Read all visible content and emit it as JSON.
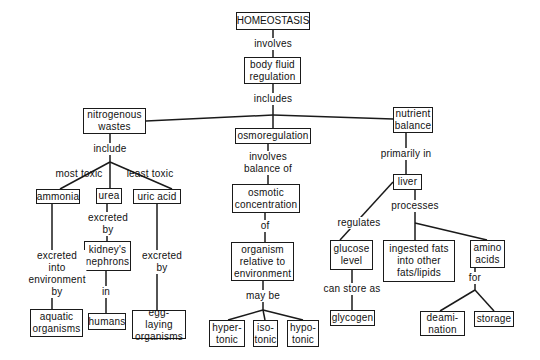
{
  "diagram": {
    "type": "concept-map",
    "root": "HOMEOSTASIS",
    "colors": {
      "line": "#1a1a1a",
      "text": "#111111",
      "background": "#ffffff"
    },
    "nodes": {
      "homeostasis": "HOMEOSTASIS",
      "body_fluid_regulation": "body fluid\nregulation",
      "nitrogenous_wastes": "nitrogenous\nwastes",
      "osmoregulation": "osmoregulation",
      "nutrient_balance": "nutrient\nbalance",
      "ammonia": "ammonia",
      "urea": "urea",
      "uric_acid": "uric acid",
      "kidneys_nephrons": "kidney's\nnephrons",
      "aquatic_organisms": "aquatic\norganisms",
      "humans": "humans",
      "egg_laying_organisms": "egg-laying\norganisms",
      "osmotic_concentration": "osmotic\nconcentration",
      "organism_relative": "organism\nrelative to\nenvironment",
      "hypertonic": "hyper-\ntonic",
      "isotonic": "iso-\ntonic",
      "hypotonic": "hypo-\ntonic",
      "liver": "liver",
      "glucose_level": "glucose\nlevel",
      "ingested_fats": "ingested fats\ninto other\nfats/lipids",
      "amino_acids": "amino\nacids",
      "glycogen": "glycogen",
      "deamination": "deami-\nnation",
      "storage": "storage"
    },
    "links": {
      "involves": "involves",
      "includes": "includes",
      "include": "include",
      "most_toxic": "most  toxic",
      "least_toxic": "least  toxic",
      "excreted_by_urea": "excreted\nby",
      "excreted_into_env": "excreted\ninto\nenvironment\nby",
      "in": "in",
      "excreted_by_uric": "excreted\nby",
      "involves_balance_of": "involves\nbalance of",
      "of": "of",
      "may_be": "may be",
      "primarily_in": "primarily  in",
      "regulates": "regulates",
      "processes": "processes",
      "can_store_as": "can store as",
      "for": "for"
    }
  }
}
